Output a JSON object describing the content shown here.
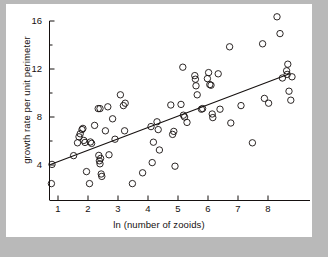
{
  "figure": {
    "background": "#ffffff",
    "page_background": "#b9b9b9",
    "ink": "#15100f"
  },
  "chart_data": {
    "type": "scatter",
    "title": "",
    "xlabel": "ln (number of zooids)",
    "ylabel": "growth rate per unit perimeter",
    "xlim": [
      0.55,
      9.05
    ],
    "ylim": [
      1.4,
      16.6
    ],
    "xticks": [
      1,
      2,
      3,
      4,
      5,
      6,
      7,
      8
    ],
    "xtick_labels": [
      "1",
      "2",
      "3",
      "4",
      "5",
      "6",
      "7",
      "8"
    ],
    "yticks": [
      4,
      8,
      12,
      16
    ],
    "ytick_labels": [
      "4",
      "8",
      "12",
      "16"
    ],
    "yticks_minor": [
      6,
      10,
      14
    ],
    "grid": false,
    "legend": null,
    "marker": "open-circle",
    "marker_size": 4.2,
    "points": [
      [
        0.78,
        2.45
      ],
      [
        0.8,
        4.05
      ],
      [
        1.52,
        4.78
      ],
      [
        1.65,
        5.85
      ],
      [
        1.7,
        6.35
      ],
      [
        1.74,
        6.6
      ],
      [
        1.8,
        6.95
      ],
      [
        1.83,
        7.05
      ],
      [
        1.86,
        6.05
      ],
      [
        1.9,
        5.88
      ],
      [
        1.95,
        3.45
      ],
      [
        2.05,
        2.45
      ],
      [
        2.08,
        5.92
      ],
      [
        2.12,
        5.8
      ],
      [
        2.22,
        7.3
      ],
      [
        2.34,
        8.7
      ],
      [
        2.4,
        8.7
      ],
      [
        2.36,
        4.8
      ],
      [
        2.38,
        4.35
      ],
      [
        2.4,
        4.1
      ],
      [
        2.42,
        4.55
      ],
      [
        2.44,
        3.25
      ],
      [
        2.46,
        3.05
      ],
      [
        2.58,
        6.85
      ],
      [
        2.66,
        8.85
      ],
      [
        2.7,
        4.85
      ],
      [
        2.82,
        7.85
      ],
      [
        2.9,
        6.15
      ],
      [
        3.08,
        9.85
      ],
      [
        3.18,
        8.95
      ],
      [
        3.24,
        9.15
      ],
      [
        3.22,
        6.85
      ],
      [
        3.48,
        2.45
      ],
      [
        3.82,
        3.35
      ],
      [
        4.1,
        7.2
      ],
      [
        4.14,
        4.2
      ],
      [
        4.18,
        5.9
      ],
      [
        4.3,
        7.6
      ],
      [
        4.34,
        6.95
      ],
      [
        4.38,
        5.25
      ],
      [
        4.76,
        9.0
      ],
      [
        4.82,
        6.55
      ],
      [
        4.86,
        6.8
      ],
      [
        4.9,
        3.9
      ],
      [
        5.1,
        9.05
      ],
      [
        5.16,
        12.15
      ],
      [
        5.18,
        8.15
      ],
      [
        5.22,
        8.0
      ],
      [
        5.3,
        7.55
      ],
      [
        5.56,
        11.45
      ],
      [
        5.58,
        11.15
      ],
      [
        5.6,
        10.6
      ],
      [
        5.64,
        9.85
      ],
      [
        5.78,
        8.65
      ],
      [
        5.82,
        8.7
      ],
      [
        5.98,
        11.2
      ],
      [
        6.02,
        11.7
      ],
      [
        6.06,
        10.7
      ],
      [
        6.1,
        10.65
      ],
      [
        6.14,
        8.25
      ],
      [
        6.16,
        7.95
      ],
      [
        6.34,
        11.6
      ],
      [
        6.4,
        8.65
      ],
      [
        6.72,
        13.85
      ],
      [
        6.76,
        7.5
      ],
      [
        7.1,
        8.95
      ],
      [
        7.48,
        5.85
      ],
      [
        7.82,
        14.1
      ],
      [
        7.88,
        9.55
      ],
      [
        8.02,
        9.15
      ],
      [
        8.3,
        16.35
      ],
      [
        8.4,
        14.95
      ],
      [
        8.48,
        11.25
      ],
      [
        8.62,
        11.85
      ],
      [
        8.64,
        11.55
      ],
      [
        8.66,
        12.4
      ],
      [
        8.7,
        10.15
      ],
      [
        8.76,
        9.4
      ],
      [
        8.8,
        11.35
      ]
    ],
    "fit_line": {
      "label": "",
      "x_start": 0.75,
      "y_start": 4.05,
      "x_end": 8.72,
      "y_end": 11.6
    }
  }
}
